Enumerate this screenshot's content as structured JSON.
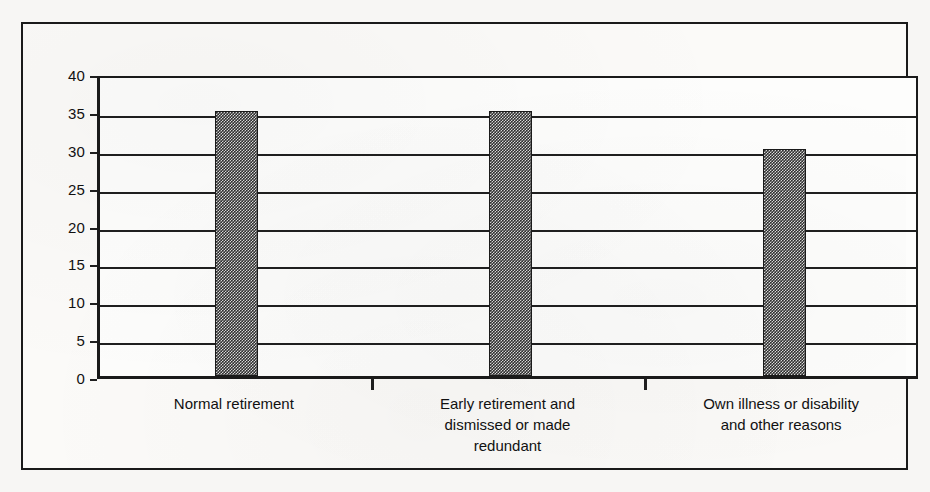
{
  "chart_data": {
    "type": "bar",
    "title": "",
    "subtitle": "",
    "xlabel": "",
    "ylabel": "",
    "categories": [
      "Normal retirement",
      "Early retirement and dismissed or made redundant",
      "Own illness or disability and other reasons"
    ],
    "category_lines": [
      [
        "Normal retirement"
      ],
      [
        "Early retirement and",
        "dismissed or made",
        "redundant"
      ],
      [
        "Own illness or disability",
        "and other reasons"
      ]
    ],
    "values": [
      35,
      35,
      30
    ],
    "ylim": [
      0,
      40
    ],
    "ytick_step": 5,
    "yticks": [
      0,
      5,
      10,
      15,
      20,
      25,
      30,
      35,
      40
    ],
    "ytick_labels": [
      "0",
      "5",
      "10",
      "15",
      "20",
      "25",
      "30",
      "35",
      "40"
    ],
    "grid": true,
    "grid_axis": "y",
    "legend": false,
    "legend_position": "none",
    "series": [
      {
        "name": "Reason for leaving last job",
        "values": [
          35,
          35,
          30
        ],
        "color": "#303030",
        "fill_pattern": "fine-checker-dither"
      }
    ],
    "annotations": [],
    "colors": {
      "bar": "#303030",
      "bar_pattern_light": "#d9d9d9",
      "axis": "#1f1f1f",
      "grid": "#1f1f1f",
      "frame": "#1a1a1a",
      "plot_background": "#fdfdfc",
      "page_background": "#f7f6f4",
      "text": "#111111"
    }
  }
}
